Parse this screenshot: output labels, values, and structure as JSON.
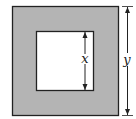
{
  "diagram": {
    "colors": {
      "frame_fill": "#b4b4b4",
      "inner_fill": "#ffffff",
      "stroke": "#222222"
    },
    "outer_square": {
      "side_label": "y"
    },
    "inner_square": {
      "side_label": "x"
    },
    "labels": {
      "inner": "x",
      "outer": "y"
    }
  }
}
